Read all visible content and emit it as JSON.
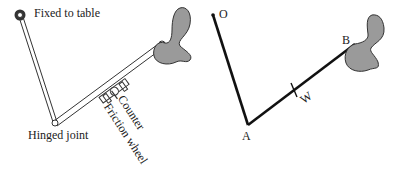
{
  "left_diagram": {
    "labels": {
      "fixed": "Fixed to table",
      "hinge": "Hinged joint",
      "counter": "Counter",
      "friction": "Friction wheel"
    }
  },
  "right_diagram": {
    "labels": {
      "o": "O",
      "a": "A",
      "b": "B",
      "w": "W"
    }
  },
  "colors": {
    "line": "#222222",
    "propeller_fill": "#9a9a9a"
  }
}
